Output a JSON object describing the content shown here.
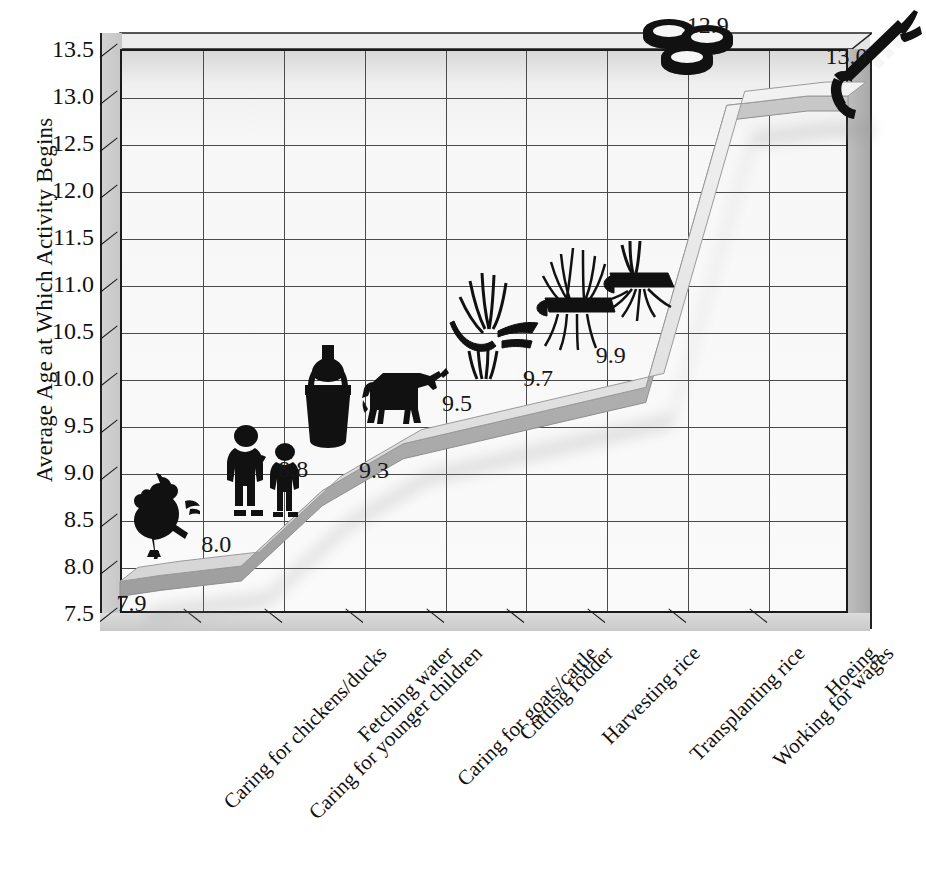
{
  "chart_data": {
    "type": "line",
    "title": "",
    "subtitle": "",
    "xlabel": "",
    "ylabel": "Average Age at Which Activity Begins",
    "ylim": [
      7.5,
      13.5
    ],
    "ytick_step": 0.5,
    "yticks": [
      "13.5",
      "13.0",
      "12.5",
      "12.0",
      "11.5",
      "11.0",
      "10.5",
      "10.0",
      "9.5",
      "9.0",
      "8.5",
      "8.0",
      "7.5"
    ],
    "grid": true,
    "legend": "none",
    "style": "3d-ribbon",
    "categories": [
      "Caring for chickens/ducks",
      "Caring for younger children",
      "Fetching water",
      "Caring for goats/cattle",
      "Cutting fodder",
      "Harvesting rice",
      "Transplanting rice",
      "Working for wages",
      "Hoeing"
    ],
    "values": [
      7.9,
      8.0,
      8.8,
      9.3,
      9.5,
      9.7,
      9.9,
      12.9,
      13.0
    ],
    "value_labels": [
      "7.9",
      "8.0",
      "8.8",
      "9.3",
      "9.5",
      "9.7",
      "9.9",
      "12.9",
      "13.0"
    ],
    "point_icons": [
      "rooster-icon",
      "two-children-icon",
      "water-vessel-icon",
      "cow-icon",
      "fodder-sickle-icon",
      "rice-sheaf-icon",
      "rice-seedling-icon",
      "coins-icon",
      "hoe-icon"
    ]
  },
  "colors": {
    "plot_background": "#fafafa",
    "grid_line": "#4a4a4a",
    "axis_line": "#1a1a1a",
    "ribbon_front": "#b4b4b4",
    "ribbon_top": "#e8e8e8",
    "wall_left": "#cccccc",
    "wall_right": "#b0b0b0",
    "icon": "#111111",
    "text": "#161616"
  }
}
